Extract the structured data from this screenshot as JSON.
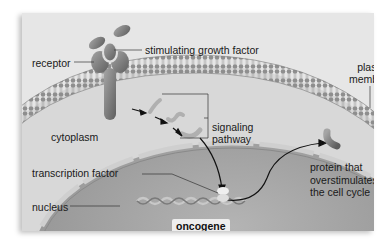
{
  "diagram": {
    "type": "cell signaling illustration",
    "labels": {
      "receptor": "receptor",
      "growth_factor": "stimulating growth factor",
      "plasma_membrane_line1": "plasma",
      "plasma_membrane_line2": "membrane",
      "cytoplasm": "cytoplasm",
      "signaling_line1": "signaling",
      "signaling_line2": "pathway",
      "transcription_factor": "transcription factor",
      "nucleus": "nucleus",
      "oncogene": "oncogene",
      "protein_line1": "protein that",
      "protein_line2": "overstimulates",
      "protein_line3": "the cell cycle"
    },
    "colors": {
      "background": "#e6e6e6",
      "cytoplasm": "#d6d6d6",
      "nucleus": "#a9a9a9",
      "membrane": "#8a8a8a",
      "protein": "#7d7d7d"
    }
  }
}
